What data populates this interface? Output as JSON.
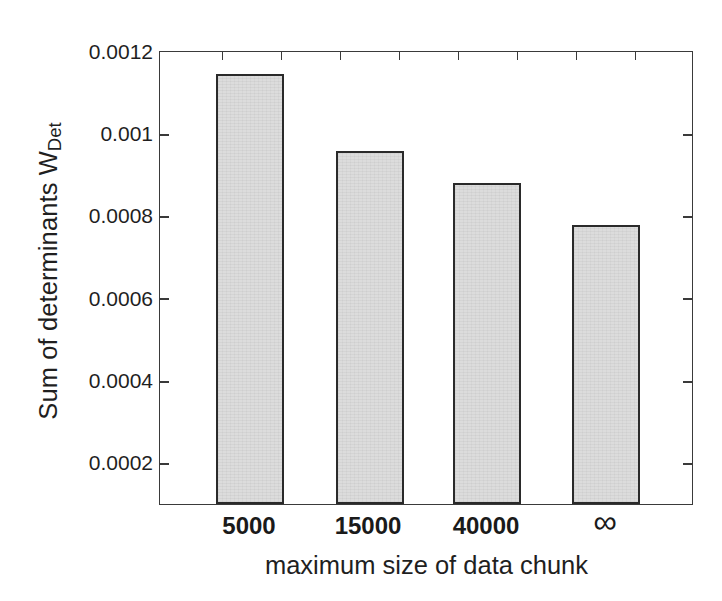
{
  "figure": {
    "top_fragment_text": "",
    "background_color": "#ffffff",
    "frame_color": "#3a3a3a",
    "bar_fill_color": "#dcdcdc",
    "bar_edge_color": "#2a2a2a"
  },
  "axes": {
    "ylabel_main": "Sum of determinants W",
    "ylabel_subscript": "Det",
    "xlabel": "maximum size of data chunk"
  },
  "chart_data": {
    "type": "bar",
    "title": "",
    "xlabel": "maximum size of data chunk",
    "ylabel": "Sum of determinants W_Det",
    "categories": [
      "5000",
      "15000",
      "40000",
      "∞"
    ],
    "values": [
      0.001142,
      0.000954,
      0.000876,
      0.000774
    ],
    "ylim": [
      9.54e-05,
      0.0012
    ],
    "yticks": [
      0.0002,
      0.0004,
      0.0006,
      0.0008,
      0.001,
      0.0012
    ],
    "ytick_labels": [
      "0.0002",
      "0.0004",
      "0.0006",
      "0.0008",
      "0.001",
      "0.0012"
    ],
    "grid": false,
    "legend": null,
    "bar_fill": "#dcdcdc",
    "bar_edge": "#2a2a2a",
    "series": [
      {
        "name": "W_Det",
        "values": [
          0.001142,
          0.000954,
          0.000876,
          0.000774
        ]
      }
    ]
  },
  "ytick_labels": {
    "t0": "0.0012",
    "t1": "0.001",
    "t2": "0.0008",
    "t3": "0.0006",
    "t4": "0.0004",
    "t5": "0.0002"
  },
  "xtick_labels": {
    "c0": "5000",
    "c1": "15000",
    "c2": "40000",
    "c3": "∞"
  }
}
